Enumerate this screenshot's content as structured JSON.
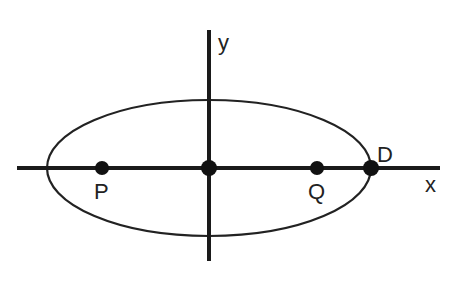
{
  "diagram": {
    "type": "ellipse-on-axes",
    "axes": {
      "x_label": "x",
      "y_label": "y"
    },
    "ellipse": {
      "cx": 209,
      "cy": 168,
      "rx": 162,
      "ry": 68
    },
    "points": [
      {
        "id": "P",
        "label": "P",
        "x": 102,
        "y": 168,
        "label_pos": "below"
      },
      {
        "id": "O",
        "label": "",
        "x": 209,
        "y": 168,
        "label_pos": "none"
      },
      {
        "id": "Q",
        "label": "Q",
        "x": 317,
        "y": 168,
        "label_pos": "below"
      },
      {
        "id": "D",
        "label": "D",
        "x": 371,
        "y": 168,
        "label_pos": "above-right"
      }
    ],
    "colors": {
      "stroke": "#1a1a1a",
      "point": "#111111",
      "background": "#ffffff"
    }
  }
}
